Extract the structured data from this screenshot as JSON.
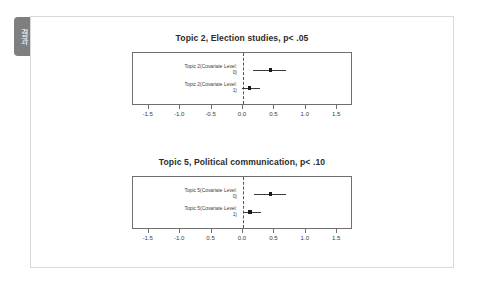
{
  "side_tab": {
    "label": "결과"
  },
  "chart_data": [
    {
      "type": "scatter",
      "title": "Topic 2, Election studies, p< .05",
      "xlabel": "",
      "ylabel": "",
      "xlim": [
        -1.75,
        1.75
      ],
      "grid": false,
      "legend": "none",
      "zero_reference_line": 0.0,
      "ticks": [
        "-1.5",
        "-1.0",
        "-0.5",
        "0.0",
        "0.5",
        "1.0",
        "1.5"
      ],
      "tick_values": [
        -1.5,
        -1.0,
        -0.5,
        0.0,
        0.5,
        1.0,
        1.5
      ],
      "points": [
        {
          "label_line1": "Topic 2(Covariate Level:",
          "label_line2": "0)",
          "estimate": 0.44,
          "ci_low": 0.16,
          "ci_high": 0.68
        },
        {
          "label_line1": "Topic 2(Covariate Level:",
          "label_line2": "1)",
          "estimate": 0.1,
          "ci_low": -0.02,
          "ci_high": 0.27
        }
      ]
    },
    {
      "type": "scatter",
      "title": "Topic 5, Political communication, p< .10",
      "xlabel": "",
      "ylabel": "",
      "xlim": [
        -1.75,
        1.75
      ],
      "grid": false,
      "legend": "none",
      "zero_reference_line": 0.0,
      "ticks": [
        "-1.5",
        "-1.0",
        "0.5",
        "0.0",
        "0.5",
        "1.0",
        "1.5"
      ],
      "tick_values": [
        -1.5,
        -1.0,
        -0.5,
        0.0,
        0.5,
        1.0,
        1.5
      ],
      "points": [
        {
          "label_line1": "Topic 5(Covariate Level:",
          "label_line2": "0)",
          "estimate": 0.44,
          "ci_low": 0.17,
          "ci_high": 0.69
        },
        {
          "label_line1": "Topic 5(Covariate Level:",
          "label_line2": "1)",
          "estimate": 0.11,
          "ci_low": 0.0,
          "ci_high": 0.28
        }
      ]
    }
  ]
}
